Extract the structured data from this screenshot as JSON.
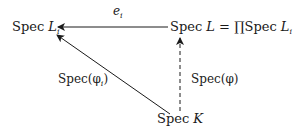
{
  "diagram": {
    "type": "commutative-diagram",
    "nodes": {
      "spec_li": {
        "prefix": "Spec ",
        "var": "L",
        "sub": "i"
      },
      "spec_l": {
        "prefix": "Spec ",
        "var": "L",
        "rest": " = ",
        "prod": "∏",
        "rest2": "Spec ",
        "var2": "L",
        "sub2": "i"
      },
      "spec_k": {
        "prefix": "Spec ",
        "var": "K"
      }
    },
    "edges": [
      {
        "from": "spec_l",
        "to": "spec_li",
        "label_main": "e",
        "label_sub": "i",
        "style": "solid"
      },
      {
        "from": "spec_k",
        "to": "spec_li",
        "label": "Spec(φ",
        "label_sub": "i",
        "label_end": ")",
        "style": "solid"
      },
      {
        "from": "spec_k",
        "to": "spec_l",
        "label": "Spec(φ)",
        "style": "dashed"
      }
    ]
  }
}
